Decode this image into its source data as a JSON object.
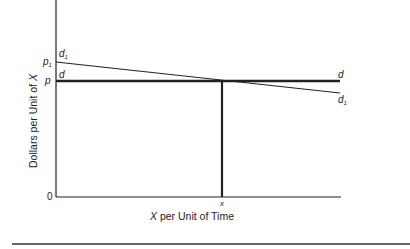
{
  "diagram": {
    "y_axis_label_prefix": "Dollars per Unit of ",
    "y_axis_label_var": "X",
    "x_axis_label_var": "X",
    "x_axis_label_suffix": " per Unit of Time",
    "origin_label": "0",
    "price_labels": {
      "p1": "p",
      "p1_sub": "1",
      "p": "p"
    },
    "x_tick_label": "x",
    "curve_labels": {
      "d_left": "d",
      "d_right": "d",
      "d1_left": "d",
      "d1_left_sub": "1",
      "d1_right": "d",
      "d1_right_sub": "1"
    },
    "colors": {
      "line": "#222222",
      "background": "#ffffff"
    }
  }
}
